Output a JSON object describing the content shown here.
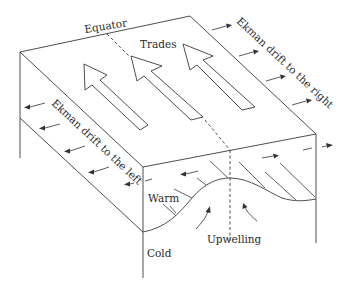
{
  "diagram": {
    "labels": {
      "equator": "Equator",
      "trades": "Trades",
      "ekman_right": "Ekman drift to the right",
      "ekman_left": "Ekman drift to the left",
      "warm": "Warm",
      "cold": "Cold",
      "upwelling": "Upwelling"
    },
    "elements": {
      "trade_wind_arrows": 3,
      "ekman_right_arrows": 4,
      "ekman_left_arrows": 5,
      "upwelling_arrows": 2
    },
    "colors": {
      "line": "#3a3a3a",
      "text": "#2a2a2a",
      "background": "#ffffff"
    }
  }
}
